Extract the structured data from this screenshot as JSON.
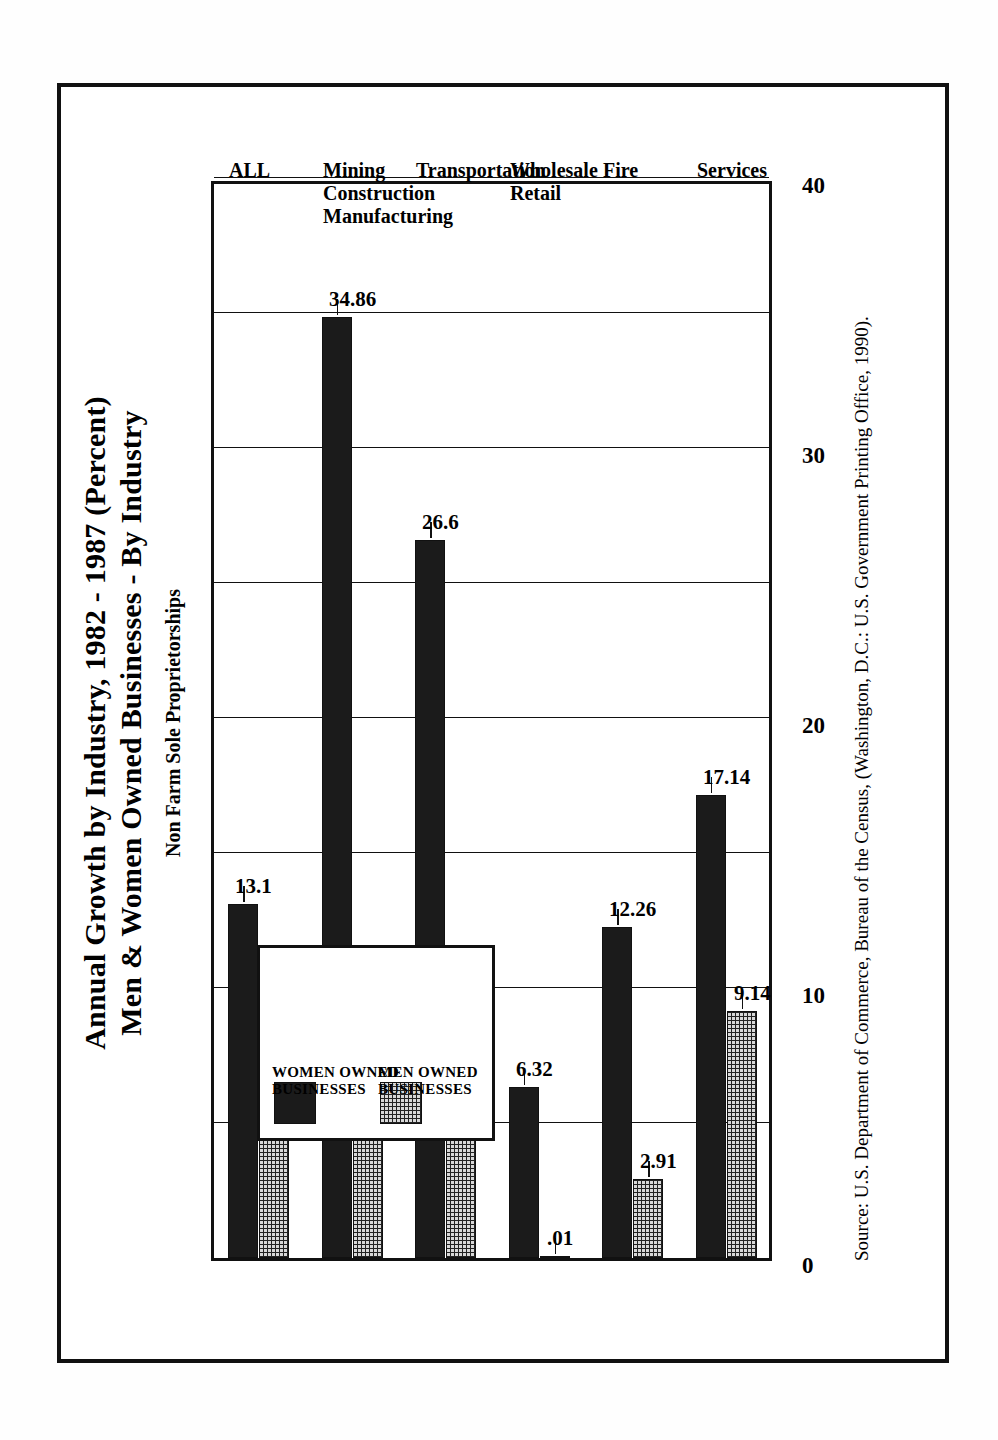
{
  "figure": {
    "title_line1": "Annual Growth by Industry, 1982 - 1987 (Percent)",
    "title_line2": "Men & Women Owned Businesses - By Industry",
    "subtitle": "Non Farm Sole Proprietorships",
    "source": "Source: U.S. Department of Commerce, Bureau of the Census, (Washington, D.C.: U.S. Government Printing Office, 1990)."
  },
  "legend": {
    "items": [
      {
        "label": "WOMEN OWNED\nBUSINESSES",
        "swatch": "solid-black"
      },
      {
        "label": "MEN OWNED\nBUSINESSES",
        "swatch": "grid-hatch"
      }
    ]
  },
  "axis": {
    "tick_labels": [
      "0",
      "10",
      "20",
      "30",
      "40"
    ],
    "tick_values": [
      0,
      10,
      20,
      30,
      40
    ],
    "gridline_values": [
      0,
      5,
      10,
      15,
      20,
      25,
      30,
      35,
      40
    ]
  },
  "chart_data": {
    "type": "bar",
    "orientation": "horizontal",
    "title": "Annual Growth by Industry, 1982 - 1987 (Percent) Men & Women Owned Businesses - By Industry",
    "subtitle": "Non Farm Sole Proprietorships",
    "xlabel": "",
    "ylabel": "",
    "xlim": [
      0,
      40
    ],
    "grid": true,
    "legend_position": "upper-left-inside",
    "categories": [
      "ALL",
      "Mining\nConstruction\nManufacturing",
      "Transportation",
      "Wholesale\nRetail",
      "Fire",
      "Services"
    ],
    "category_labels": [
      "ALL",
      "Mining Construction Manufacturing",
      "Transportation",
      "Wholesale Retail",
      "Fire",
      "Services"
    ],
    "series": [
      {
        "name": "WOMEN OWNED BUSINESSES",
        "color": "#1b1b1b",
        "values": [
          13.1,
          34.86,
          26.6,
          6.32,
          12.26,
          17.14
        ],
        "value_labels": [
          "13.1",
          "34.86",
          "26.6",
          "6.32",
          "12.26",
          "17.14"
        ]
      },
      {
        "name": "MEN OWNED BUSINESSES",
        "color": "#d8d8d8",
        "values": [
          4.83,
          6.3,
          5.75,
          0.01,
          2.91,
          9.14
        ],
        "value_labels": [
          "4.83",
          "6.3",
          "5.75",
          ".01",
          "2.91",
          "9.14"
        ]
      }
    ]
  }
}
